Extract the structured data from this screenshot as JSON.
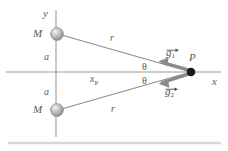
{
  "figure": {
    "axes": {
      "y_label": "y",
      "x_label": "x"
    },
    "masses": [
      {
        "label": "M",
        "position": "upper"
      },
      {
        "label": "M",
        "position": "lower"
      }
    ],
    "distances": [
      {
        "label": "a",
        "position": "upper"
      },
      {
        "label": "a",
        "position": "lower"
      }
    ],
    "radii": [
      {
        "label": "r",
        "position": "upper"
      },
      {
        "label": "r",
        "position": "lower"
      }
    ],
    "angles": [
      {
        "label": "θ",
        "position": "upper"
      },
      {
        "label": "θ",
        "position": "lower"
      }
    ],
    "point": {
      "label": "P",
      "x_label": "x",
      "x_subscript": "P"
    },
    "vectors": [
      {
        "symbol": "g",
        "subscript": "1",
        "label": "g⃗1"
      },
      {
        "symbol": "g",
        "subscript": "2",
        "label": "g⃗2"
      }
    ],
    "colors": {
      "line": "#8c8c8c",
      "axis": "#9a9a9a",
      "text": "#5a5a5a",
      "vector": "#8a8a8a",
      "sphere": "#b5b5b5",
      "point": "#1a1a1a",
      "baseline": "#d8d8d8"
    }
  }
}
